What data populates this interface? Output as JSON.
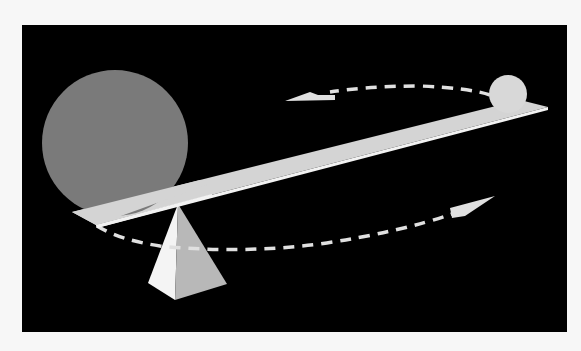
{
  "figure": {
    "colors": {
      "page_background": "#f7f7f7",
      "panel_background": "#000000",
      "large_sphere": "#7a7a7a",
      "small_sphere": "#d8d8d8",
      "beam_top": "#d4d4d4",
      "beam_edge": "#f2f2f2",
      "fulcrum_light": "#f4f4f4",
      "fulcrum_shade": "#b8b8b8",
      "arrow": "#e0e0e0"
    },
    "objects": [
      {
        "name": "large-sphere",
        "position": "left end of beam"
      },
      {
        "name": "small-sphere",
        "position": "right end of beam"
      },
      {
        "name": "beam",
        "orientation": "tilted, rising to the right"
      },
      {
        "name": "fulcrum-pyramid",
        "position": "under beam, left of center"
      },
      {
        "name": "upper-dashed-arrow",
        "direction": "pointing left"
      },
      {
        "name": "lower-dashed-arrow",
        "direction": "pointing right"
      }
    ]
  }
}
